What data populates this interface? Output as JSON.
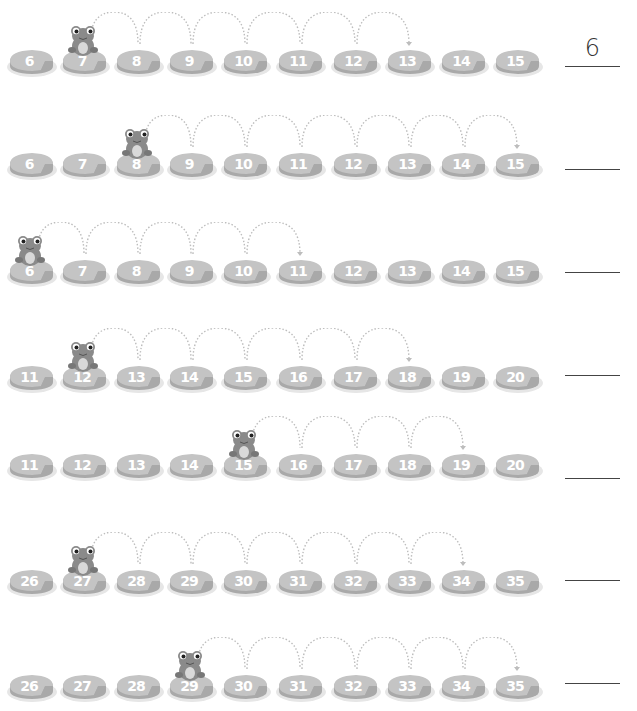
{
  "worksheet": {
    "rows": [
      {
        "pads": [
          "6",
          "7",
          "8",
          "9",
          "10",
          "11",
          "12",
          "13",
          "14",
          "15"
        ],
        "frog_index": 1,
        "hop_end_index": 7,
        "answer": "6"
      },
      {
        "pads": [
          "6",
          "7",
          "8",
          "9",
          "10",
          "11",
          "12",
          "13",
          "14",
          "15"
        ],
        "frog_index": 2,
        "hop_end_index": 9,
        "answer": ""
      },
      {
        "pads": [
          "6",
          "7",
          "8",
          "9",
          "10",
          "11",
          "12",
          "13",
          "14",
          "15"
        ],
        "frog_index": 0,
        "hop_end_index": 5,
        "answer": ""
      },
      {
        "pads": [
          "11",
          "12",
          "13",
          "14",
          "15",
          "16",
          "17",
          "18",
          "19",
          "20"
        ],
        "frog_index": 1,
        "hop_end_index": 7,
        "answer": ""
      },
      {
        "pads": [
          "11",
          "12",
          "13",
          "14",
          "15",
          "16",
          "17",
          "18",
          "19",
          "20"
        ],
        "frog_index": 4,
        "hop_end_index": 8,
        "answer": ""
      },
      {
        "pads": [
          "26",
          "27",
          "28",
          "29",
          "30",
          "31",
          "32",
          "33",
          "34",
          "35"
        ],
        "frog_index": 1,
        "hop_end_index": 8,
        "answer": ""
      },
      {
        "pads": [
          "26",
          "27",
          "28",
          "29",
          "30",
          "31",
          "32",
          "33",
          "34",
          "35"
        ],
        "frog_index": 3,
        "hop_end_index": 9,
        "answer": ""
      }
    ]
  },
  "colors": {
    "pad_top": "#c4c4c4",
    "pad_side": "#a9a9a9",
    "pad_shadow": "#e6e6e6",
    "frog_body": "#8a8a8a",
    "hop_dots": "#bdbdbd",
    "answer_line": "#444444"
  },
  "icons": {
    "frog": "frog-icon",
    "lily_pad": "lily-pad-icon",
    "hop_arrow": "hop-arrow-icon"
  }
}
